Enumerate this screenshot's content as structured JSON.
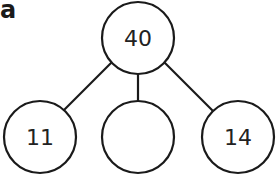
{
  "label": "a",
  "colors": {
    "stroke": "#1a1a1a",
    "fill": "#ffffff",
    "text": "#222222"
  },
  "tree": {
    "root": {
      "value": "40"
    },
    "children": [
      {
        "value": "11"
      },
      {
        "value": ""
      },
      {
        "value": "14"
      }
    ]
  }
}
